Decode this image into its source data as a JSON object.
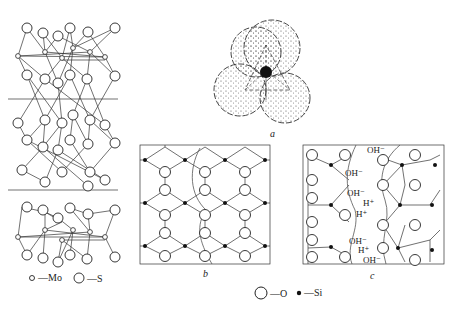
{
  "panels": {
    "a": {
      "label": "a"
    },
    "b": {
      "label": "b"
    },
    "c": {
      "label": "c"
    }
  },
  "legend_mos2": {
    "mo": {
      "symbol": "small-open-circle",
      "text": "—Mo"
    },
    "s": {
      "symbol": "large-open-circle",
      "text": "—S"
    }
  },
  "legend_silica": {
    "o": {
      "symbol": "large-open-circle",
      "text": "—O"
    },
    "si": {
      "symbol": "small-filled-circle",
      "text": "—Si"
    }
  },
  "panel_c_ions": [
    {
      "text": "OH⁻"
    },
    {
      "text": "OH⁻"
    },
    {
      "text": "OH⁻"
    },
    {
      "text": "H⁺"
    },
    {
      "text": "H⁺"
    },
    {
      "text": "OH⁻"
    },
    {
      "text": "H⁺"
    },
    {
      "text": "OH⁻"
    }
  ],
  "colors": {
    "line": "#333333",
    "background": "#ffffff"
  }
}
